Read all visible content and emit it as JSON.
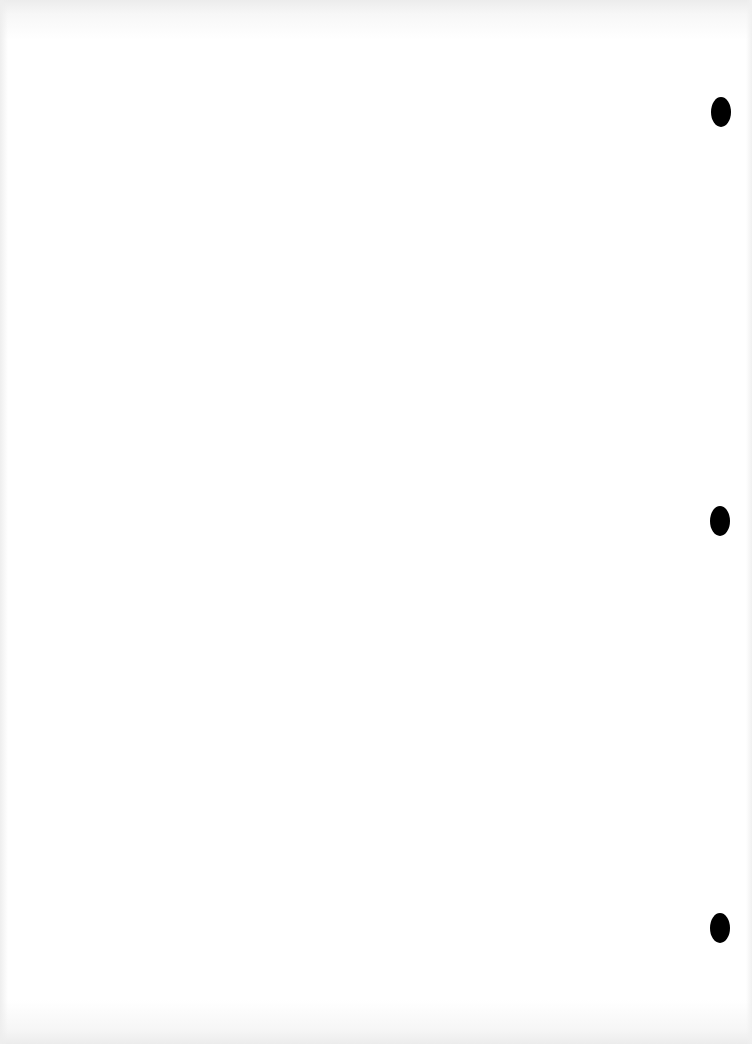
{
  "document": {
    "type": "scanned-blank-page",
    "text_content": "",
    "background_color": "#ffffff",
    "punch_holes": [
      {
        "name": "punch-hole-top",
        "cx": 721,
        "cy": 112,
        "w": 20,
        "h": 30,
        "color": "#000000"
      },
      {
        "name": "punch-hole-middle",
        "cx": 720,
        "cy": 521,
        "w": 20,
        "h": 30,
        "color": "#000000"
      },
      {
        "name": "punch-hole-bottom",
        "cx": 720,
        "cy": 928,
        "w": 20,
        "h": 30,
        "color": "#000000"
      }
    ]
  }
}
